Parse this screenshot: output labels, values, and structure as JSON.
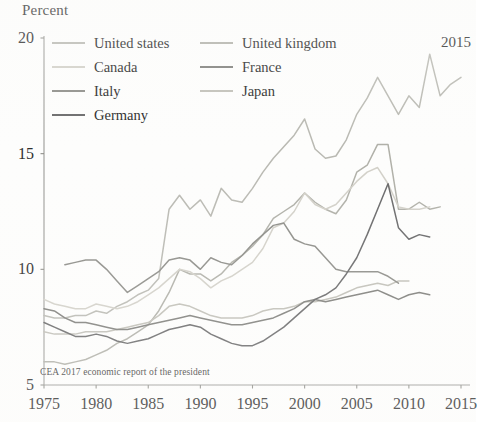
{
  "axis": {
    "ylabel": "Percent",
    "yticks": [
      "20",
      "15",
      "10",
      "5"
    ],
    "xticks": [
      "1975",
      "1980",
      "1985",
      "1990",
      "1995",
      "2000",
      "2005",
      "2010",
      "2015"
    ]
  },
  "annotation": {
    "corner_year": "2015"
  },
  "source_note": "CEA 2017 economic report of the president",
  "legend": {
    "left": [
      {
        "label": "United states",
        "color": "#b9b9b2"
      },
      {
        "label": "Canada",
        "color": "#d2d0c8"
      },
      {
        "label": "Italy",
        "color": "#8d8d88"
      },
      {
        "label": "Germany",
        "color": "#69696a"
      }
    ],
    "right": [
      {
        "label": "United kingdom",
        "color": "#b0b0a8"
      },
      {
        "label": "France",
        "color": "#7e7e7a"
      },
      {
        "label": "Japan",
        "color": "#c0bfb7"
      }
    ]
  },
  "chart_data": {
    "type": "line",
    "title": "",
    "subtitle": "",
    "xlabel": "",
    "ylabel": "Percent",
    "xlim": [
      1975,
      2015
    ],
    "ylim": [
      5,
      20
    ],
    "grid": false,
    "legend_position": "top-left",
    "xticks": [
      1975,
      1980,
      1985,
      1990,
      1995,
      2000,
      2005,
      2010,
      2015
    ],
    "yticks": [
      5,
      10,
      15,
      20
    ],
    "note": "Top income share, percent, seven advanced economies, 1975-2015",
    "series": [
      {
        "name": "United states",
        "color": "#b9b9b2",
        "x": [
          1975,
          1976,
          1977,
          1978,
          1979,
          1980,
          1981,
          1982,
          1983,
          1984,
          1985,
          1986,
          1987,
          1988,
          1989,
          1990,
          1991,
          1992,
          1993,
          1994,
          1995,
          1996,
          1997,
          1998,
          1999,
          2000,
          2001,
          2002,
          2003,
          2004,
          2005,
          2006,
          2007,
          2008,
          2009,
          2010,
          2011,
          2012,
          2013,
          2014,
          2015
        ],
        "y": [
          8.0,
          7.9,
          7.9,
          8.0,
          8.0,
          8.2,
          8.1,
          8.4,
          8.6,
          8.9,
          9.1,
          9.6,
          12.6,
          13.2,
          12.6,
          13.0,
          12.3,
          13.5,
          13.0,
          12.9,
          13.5,
          14.2,
          14.8,
          15.3,
          15.8,
          16.5,
          15.2,
          14.8,
          14.9,
          15.6,
          16.7,
          17.4,
          18.3,
          17.5,
          16.7,
          17.5,
          17.0,
          19.3,
          17.5,
          18.0,
          18.3
        ]
      },
      {
        "name": "United kingdom",
        "color": "#b0b0a8",
        "x": [
          1975,
          1976,
          1977,
          1978,
          1979,
          1980,
          1981,
          1982,
          1983,
          1984,
          1985,
          1986,
          1987,
          1988,
          1989,
          1990,
          1991,
          1992,
          1993,
          1994,
          1995,
          1996,
          1997,
          1998,
          1999,
          2000,
          2001,
          2002,
          2003,
          2004,
          2005,
          2006,
          2007,
          2008,
          2009,
          2010,
          2011,
          2012,
          2013
        ],
        "y": [
          6.0,
          6.0,
          5.9,
          6.0,
          6.1,
          6.3,
          6.5,
          6.8,
          7.0,
          7.3,
          7.6,
          8.2,
          9.0,
          10.0,
          9.8,
          9.8,
          9.5,
          9.8,
          10.3,
          10.6,
          11.0,
          11.5,
          12.2,
          12.5,
          12.8,
          13.3,
          12.9,
          12.6,
          12.4,
          13.0,
          14.2,
          14.5,
          15.4,
          15.4,
          12.6,
          12.6,
          12.9,
          12.6,
          12.7
        ]
      },
      {
        "name": "Canada",
        "color": "#d2d0c8",
        "x": [
          1975,
          1976,
          1977,
          1978,
          1979,
          1980,
          1981,
          1982,
          1983,
          1984,
          1985,
          1986,
          1987,
          1988,
          1989,
          1990,
          1991,
          1992,
          1993,
          1994,
          1995,
          1996,
          1997,
          1998,
          1999,
          2000,
          2001,
          2002,
          2003,
          2004,
          2005,
          2006,
          2007,
          2008,
          2009,
          2010,
          2011,
          2012
        ],
        "y": [
          8.7,
          8.5,
          8.4,
          8.3,
          8.3,
          8.5,
          8.4,
          8.3,
          8.4,
          8.6,
          8.9,
          9.2,
          9.6,
          10.0,
          9.9,
          9.6,
          9.2,
          9.5,
          9.7,
          10.0,
          10.3,
          10.9,
          11.8,
          12.0,
          12.5,
          13.3,
          12.8,
          12.6,
          12.8,
          13.3,
          13.8,
          14.2,
          14.4,
          13.7,
          12.7,
          12.6,
          12.6,
          12.7
        ]
      },
      {
        "name": "Japan",
        "color": "#c0bfb7",
        "x": [
          1975,
          1976,
          1977,
          1978,
          1979,
          1980,
          1981,
          1982,
          1983,
          1984,
          1985,
          1986,
          1987,
          1988,
          1989,
          1990,
          1991,
          1992,
          1993,
          1994,
          1995,
          1996,
          1997,
          1998,
          1999,
          2000,
          2001,
          2002,
          2003,
          2004,
          2005,
          2006,
          2007,
          2008,
          2009,
          2010
        ],
        "y": [
          7.3,
          7.2,
          7.2,
          7.2,
          7.3,
          7.3,
          7.3,
          7.4,
          7.5,
          7.6,
          7.7,
          8.0,
          8.4,
          8.5,
          8.4,
          8.2,
          8.0,
          7.9,
          7.9,
          7.9,
          8.0,
          8.2,
          8.3,
          8.3,
          8.4,
          8.6,
          8.6,
          8.7,
          8.8,
          9.0,
          9.2,
          9.3,
          9.4,
          9.3,
          9.5,
          9.5
        ]
      },
      {
        "name": "Italy",
        "color": "#8d8d88",
        "x": [
          1977,
          1978,
          1979,
          1980,
          1981,
          1982,
          1983,
          1984,
          1985,
          1986,
          1987,
          1988,
          1989,
          1990,
          1991,
          1992,
          1993,
          1994,
          1995,
          1996,
          1997,
          1998,
          1999,
          2000,
          2001,
          2002,
          2003,
          2004,
          2005,
          2006,
          2007,
          2008,
          2009
        ],
        "y": [
          10.2,
          10.3,
          10.4,
          10.4,
          10.0,
          9.5,
          9.0,
          9.3,
          9.6,
          9.9,
          10.4,
          10.5,
          10.4,
          10.0,
          10.5,
          10.3,
          10.2,
          10.6,
          11.1,
          11.5,
          11.9,
          12.0,
          11.3,
          11.1,
          11.0,
          10.5,
          10.0,
          9.9,
          9.9,
          9.9,
          9.9,
          9.7,
          9.4
        ]
      },
      {
        "name": "France",
        "color": "#7e7e7a",
        "x": [
          1975,
          1976,
          1977,
          1978,
          1979,
          1980,
          1981,
          1982,
          1983,
          1984,
          1985,
          1986,
          1987,
          1988,
          1989,
          1990,
          1991,
          1992,
          1993,
          1994,
          1995,
          1996,
          1997,
          1998,
          1999,
          2000,
          2001,
          2002,
          2003,
          2004,
          2005,
          2006,
          2007,
          2008,
          2009,
          2010,
          2011,
          2012
        ],
        "y": [
          8.3,
          8.2,
          7.9,
          7.7,
          7.7,
          7.6,
          7.5,
          7.4,
          7.4,
          7.5,
          7.6,
          7.7,
          7.8,
          7.9,
          8.0,
          7.9,
          7.8,
          7.7,
          7.6,
          7.6,
          7.7,
          7.8,
          7.9,
          8.1,
          8.3,
          8.6,
          8.7,
          8.6,
          8.7,
          8.8,
          8.9,
          9.0,
          9.1,
          8.9,
          8.7,
          8.9,
          9.0,
          8.9
        ]
      },
      {
        "name": "Germany",
        "color": "#69696a",
        "x": [
          1975,
          1976,
          1977,
          1978,
          1979,
          1980,
          1981,
          1982,
          1983,
          1984,
          1985,
          1986,
          1987,
          1988,
          1989,
          1990,
          1991,
          1992,
          1993,
          1994,
          1995,
          1996,
          1997,
          1998,
          1999,
          2000,
          2001,
          2002,
          2003,
          2004,
          2005,
          2006,
          2007,
          2008,
          2009,
          2010,
          2011,
          2012
        ],
        "y": [
          7.7,
          7.5,
          7.3,
          7.1,
          7.1,
          7.2,
          7.1,
          6.9,
          6.8,
          6.9,
          7.0,
          7.2,
          7.4,
          7.5,
          7.6,
          7.5,
          7.2,
          7.0,
          6.8,
          6.7,
          6.7,
          6.9,
          7.2,
          7.5,
          7.9,
          8.3,
          8.7,
          8.9,
          9.2,
          9.8,
          10.5,
          11.5,
          12.6,
          13.7,
          11.8,
          11.3,
          11.5,
          11.4
        ]
      }
    ]
  }
}
